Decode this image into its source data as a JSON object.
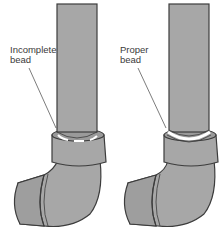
{
  "diagram": {
    "type": "illustration",
    "panels": [
      {
        "id": "left",
        "label_line1": "Incomplete",
        "label_line2": "bead",
        "state": "incomplete-solder-bead"
      },
      {
        "id": "right",
        "label_line1": "Proper",
        "label_line2": "bead",
        "state": "proper-solder-bead"
      }
    ],
    "colors": {
      "pipe_fill": "#a7a7a7",
      "outline": "#3c3c3c",
      "bead_proper": "#ffffff",
      "background": "#ffffff"
    }
  }
}
